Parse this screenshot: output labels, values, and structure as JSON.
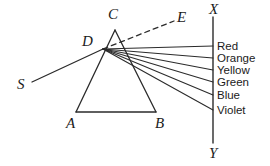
{
  "diagram": {
    "background_color": "#ffffff",
    "line_color": "#2b2b2b",
    "text_color": "#1b1b1b",
    "labels": {
      "source_ray": "S",
      "prism_apex": "C",
      "prism_base_left": "A",
      "prism_base_right": "B",
      "dispersion_point": "D",
      "undeviated_ray": "E",
      "screen_top": "X",
      "screen_bottom": "Y"
    },
    "spectrum": [
      {
        "name": "Red",
        "y": 46
      },
      {
        "name": "Orange",
        "y": 58
      },
      {
        "name": "Yellow",
        "y": 70
      },
      {
        "name": "Green",
        "y": 82
      },
      {
        "name": "Blue",
        "y": 95
      },
      {
        "name": "Violet",
        "y": 110
      }
    ],
    "geometry": {
      "prism_apex": {
        "x": 115,
        "y": 30
      },
      "prism_base_left": {
        "x": 76,
        "y": 112
      },
      "prism_base_right": {
        "x": 156,
        "y": 112
      },
      "dispersion_point": {
        "x": 103,
        "y": 49
      },
      "source_start": {
        "x": 32,
        "y": 82
      },
      "dashed_end": {
        "x": 174,
        "y": 21
      },
      "screen_x": 213,
      "screen_top_y": 17,
      "screen_bottom_y": 143
    }
  }
}
